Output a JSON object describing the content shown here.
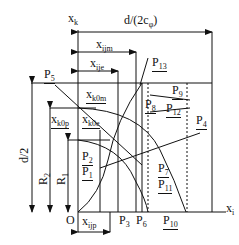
{
  "diagram": {
    "axes": {
      "vertical": {
        "base": "x",
        "sub": "k"
      },
      "horizontal": {
        "base": "x",
        "sub": "i"
      },
      "origin": "O"
    },
    "dimensions": {
      "d_2c": "d/(2c",
      "d_2c_sub": "φ",
      "d_2c_end": ")",
      "xijm": {
        "base": "x",
        "sub": "ijm"
      },
      "xije": {
        "base": "x",
        "sub": "ije"
      },
      "xijp": {
        "base": "x",
        "sub": "ijp"
      },
      "d2": "d/2",
      "R2": {
        "base": "R",
        "sub": "2"
      },
      "R1": {
        "base": "R",
        "sub": "1"
      }
    },
    "labels": {
      "xk0m": {
        "base": "x",
        "sub": "k0m"
      },
      "xk0p": {
        "base": "x",
        "sub": "k0p"
      },
      "xk0e": {
        "base": "x",
        "sub": "k0e"
      }
    },
    "points": [
      {
        "base": "P",
        "sub": "1"
      },
      {
        "base": "P",
        "sub": "2"
      },
      {
        "base": "P",
        "sub": "3"
      },
      {
        "base": "P",
        "sub": "4"
      },
      {
        "base": "P",
        "sub": "5"
      },
      {
        "base": "P",
        "sub": "6"
      },
      {
        "base": "P",
        "sub": "7"
      },
      {
        "base": "P",
        "sub": "8"
      },
      {
        "base": "P",
        "sub": "9"
      },
      {
        "base": "P",
        "sub": "10"
      },
      {
        "base": "P",
        "sub": "11"
      },
      {
        "base": "P",
        "sub": "12"
      },
      {
        "base": "P",
        "sub": "13"
      }
    ]
  }
}
